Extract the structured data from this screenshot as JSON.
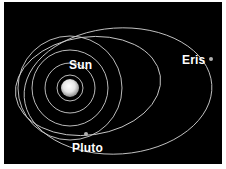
{
  "diagram": {
    "title": "",
    "background": "#000000",
    "orbit_color": "#cfcfcf",
    "labels": {
      "sun": "Sun",
      "pluto": "Pluto",
      "eris": "Eris"
    },
    "bodies": [
      {
        "name": "Sun",
        "x": 70,
        "y": 88,
        "radius": 9,
        "color": "#ffffff"
      },
      {
        "name": "Pluto",
        "x": 86,
        "y": 134,
        "radius": 2,
        "color": "#aaaaaa"
      },
      {
        "name": "Eris",
        "x": 211,
        "y": 59,
        "radius": 2,
        "color": "#aaaaaa"
      }
    ],
    "orbits": [
      {
        "type": "circle",
        "cx": 70,
        "cy": 88,
        "r": 13
      },
      {
        "type": "circle",
        "cx": 70,
        "cy": 88,
        "r": 25
      },
      {
        "type": "circle",
        "cx": 70,
        "cy": 88,
        "r": 38
      },
      {
        "type": "circle",
        "cx": 70,
        "cy": 88,
        "r": 52
      },
      {
        "type": "ellipse",
        "name": "Pluto orbit",
        "cx": 88,
        "cy": 86,
        "rx": 73,
        "ry": 49
      },
      {
        "type": "ellipse",
        "name": "Eris orbit",
        "cx": 118,
        "cy": 91,
        "rx": 94,
        "ry": 63
      }
    ]
  }
}
